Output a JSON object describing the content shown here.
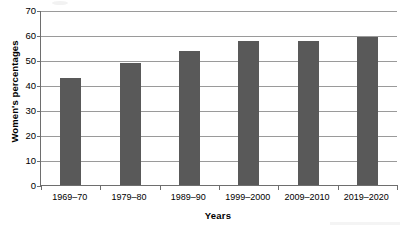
{
  "chart_data": {
    "type": "bar",
    "title": "",
    "subtitle": "",
    "xlabel": "Years",
    "ylabel": "Women's percentages",
    "categories": [
      "1969–70",
      "1979–80",
      "1989–90",
      "1999–2000",
      "2009–2010",
      "2019–2020"
    ],
    "values": [
      43,
      49,
      53.5,
      57.5,
      57.8,
      59.3
    ],
    "series": [
      {
        "name": "Women's percentages",
        "values": [
          43,
          49,
          53.5,
          57.5,
          57.8,
          59.3
        ]
      }
    ],
    "ylim": [
      0,
      70
    ],
    "yticks": [
      0,
      10,
      20,
      30,
      40,
      50,
      60,
      70
    ],
    "ytick_labels": [
      "0",
      "10",
      "20",
      "30",
      "40",
      "50",
      "60",
      "70"
    ],
    "grid": true,
    "grid_axis": "y",
    "legend": false,
    "legend_position": "none",
    "bar_color": "#595959",
    "gridline_color": "#9a9a9a",
    "axis_color": "#6e6e6e",
    "background_color": "#ffffff",
    "annotations": []
  }
}
